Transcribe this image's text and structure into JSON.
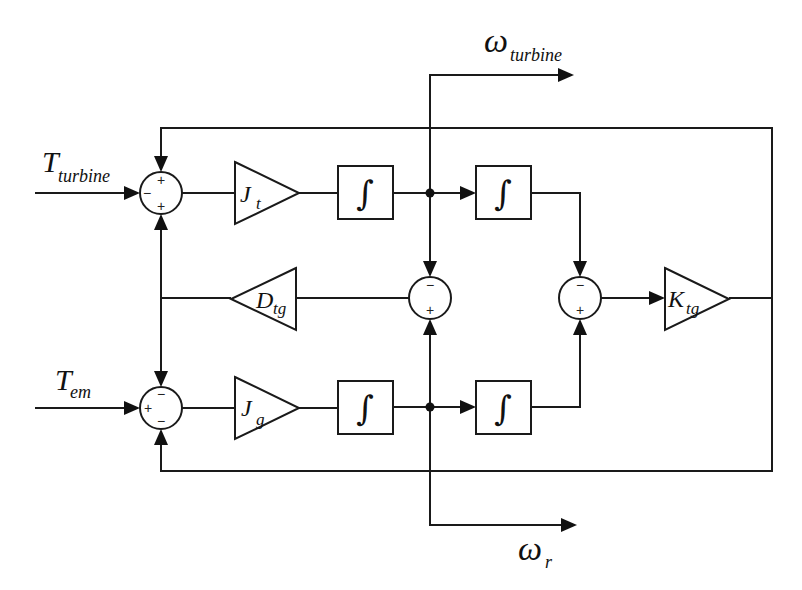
{
  "diagram": {
    "type": "block-diagram",
    "inputs": {
      "t_turbine": {
        "main": "T",
        "sub": "turbine"
      },
      "t_em": {
        "main": "T",
        "sub": "em"
      }
    },
    "outputs": {
      "omega_turbine": {
        "main": "ω",
        "sub": "turbine"
      },
      "omega_r": {
        "main": "ω",
        "sub": "r"
      }
    },
    "gains": {
      "j_t": {
        "main": "J",
        "sub": "t"
      },
      "j_g": {
        "main": "J",
        "sub": "g"
      },
      "d_tg": {
        "main": "D",
        "sub": "tg"
      },
      "k_tg": {
        "main": "K",
        "sub": "tg"
      }
    },
    "integrator_symbol": "∫",
    "sums": {
      "top_left": {
        "top": "+",
        "left": "−",
        "bottom": "+"
      },
      "bottom_left": {
        "top": "−",
        "left": "+",
        "bottom": "−"
      },
      "middle": {
        "top": "−",
        "bottom": "+"
      },
      "right": {
        "top": "−",
        "bottom": "+"
      }
    }
  }
}
